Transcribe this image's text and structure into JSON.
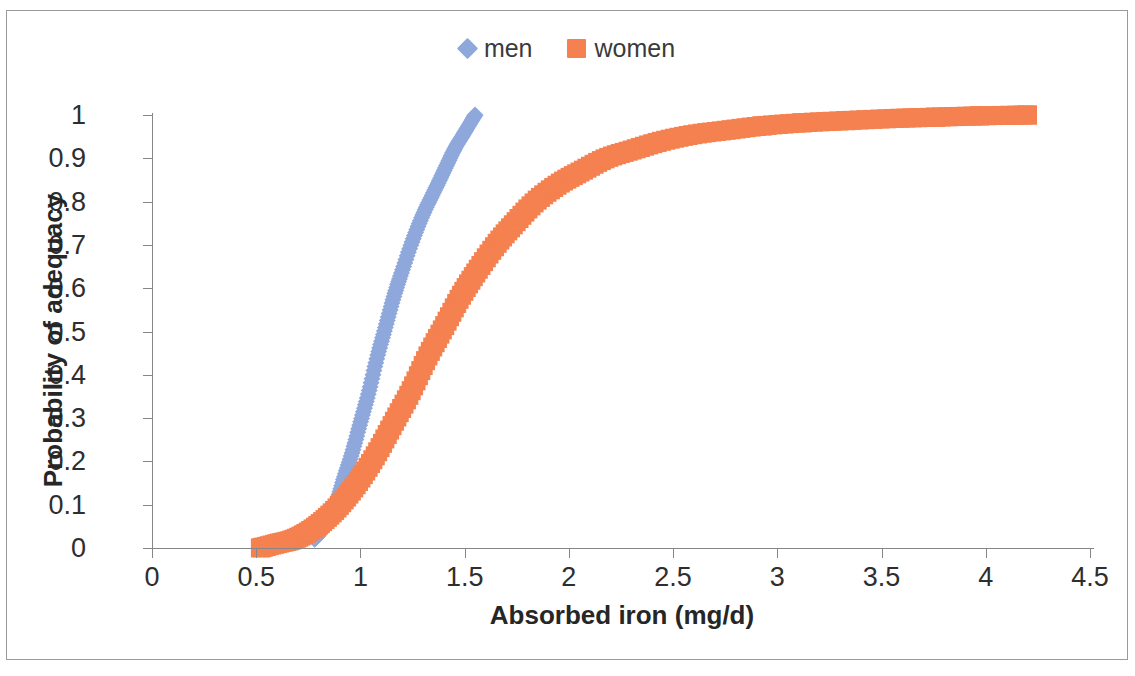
{
  "chart_data": {
    "type": "scatter",
    "title": "",
    "xlabel": "Absorbed iron (mg/d)",
    "ylabel": "Probability of adequacy",
    "xlim": [
      0,
      4.5
    ],
    "ylim": [
      0,
      1
    ],
    "xticks": [
      "0",
      "0.5",
      "1",
      "1.5",
      "2",
      "2.5",
      "3",
      "3.5",
      "4",
      "4.5"
    ],
    "xtick_values": [
      0,
      0.5,
      1,
      1.5,
      2,
      2.5,
      3,
      3.5,
      4,
      4.5
    ],
    "yticks": [
      "0",
      "0.1",
      "0.2",
      "0.3",
      "0.4",
      "0.5",
      "0.6",
      "0.7",
      "0.8",
      "0.9",
      "1"
    ],
    "ytick_values": [
      0,
      0.1,
      0.2,
      0.3,
      0.4,
      0.5,
      0.6,
      0.7,
      0.8,
      0.9,
      1
    ],
    "grid": false,
    "legend_position": "top-center",
    "series": [
      {
        "name": "men",
        "color": "#8FA8DC",
        "marker": "diamond",
        "band_width": 0.052,
        "points": [
          {
            "x": 0.78,
            "y": 0.02
          },
          {
            "x": 0.83,
            "y": 0.05
          },
          {
            "x": 0.88,
            "y": 0.1
          },
          {
            "x": 0.92,
            "y": 0.16
          },
          {
            "x": 0.96,
            "y": 0.22
          },
          {
            "x": 1.0,
            "y": 0.29
          },
          {
            "x": 1.04,
            "y": 0.36
          },
          {
            "x": 1.08,
            "y": 0.44
          },
          {
            "x": 1.12,
            "y": 0.51
          },
          {
            "x": 1.16,
            "y": 0.58
          },
          {
            "x": 1.2,
            "y": 0.64
          },
          {
            "x": 1.25,
            "y": 0.71
          },
          {
            "x": 1.3,
            "y": 0.77
          },
          {
            "x": 1.35,
            "y": 0.82
          },
          {
            "x": 1.4,
            "y": 0.87
          },
          {
            "x": 1.45,
            "y": 0.92
          },
          {
            "x": 1.5,
            "y": 0.96
          },
          {
            "x": 1.55,
            "y": 1.0
          }
        ]
      },
      {
        "name": "women",
        "color": "#F4814F",
        "marker": "square",
        "band_width": 0.06,
        "points": [
          {
            "x": 0.52,
            "y": 0.0
          },
          {
            "x": 0.6,
            "y": 0.01
          },
          {
            "x": 0.68,
            "y": 0.02
          },
          {
            "x": 0.76,
            "y": 0.04
          },
          {
            "x": 0.84,
            "y": 0.07
          },
          {
            "x": 0.92,
            "y": 0.11
          },
          {
            "x": 1.0,
            "y": 0.16
          },
          {
            "x": 1.08,
            "y": 0.22
          },
          {
            "x": 1.16,
            "y": 0.29
          },
          {
            "x": 1.24,
            "y": 0.36
          },
          {
            "x": 1.32,
            "y": 0.44
          },
          {
            "x": 1.4,
            "y": 0.51
          },
          {
            "x": 1.48,
            "y": 0.58
          },
          {
            "x": 1.56,
            "y": 0.64
          },
          {
            "x": 1.65,
            "y": 0.7
          },
          {
            "x": 1.74,
            "y": 0.75
          },
          {
            "x": 1.84,
            "y": 0.8
          },
          {
            "x": 1.95,
            "y": 0.84
          },
          {
            "x": 2.06,
            "y": 0.87
          },
          {
            "x": 2.18,
            "y": 0.9
          },
          {
            "x": 2.31,
            "y": 0.92
          },
          {
            "x": 2.45,
            "y": 0.94
          },
          {
            "x": 2.6,
            "y": 0.955
          },
          {
            "x": 2.76,
            "y": 0.965
          },
          {
            "x": 2.93,
            "y": 0.975
          },
          {
            "x": 3.12,
            "y": 0.982
          },
          {
            "x": 3.33,
            "y": 0.987
          },
          {
            "x": 3.56,
            "y": 0.992
          },
          {
            "x": 3.76,
            "y": 0.995
          },
          {
            "x": 3.97,
            "y": 0.998
          },
          {
            "x": 4.2,
            "y": 1.0
          }
        ]
      }
    ]
  },
  "legend": {
    "entries": [
      {
        "label": "men",
        "marker": "diamond",
        "color": "#8FA8DC"
      },
      {
        "label": "women",
        "marker": "square",
        "color": "#F4814F"
      }
    ]
  }
}
